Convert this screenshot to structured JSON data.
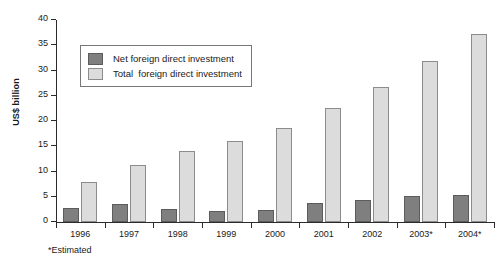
{
  "chart_data": {
    "type": "bar",
    "title": "",
    "xlabel": "",
    "ylabel": "US$ billion",
    "ylim": [
      0,
      40
    ],
    "yticks": [
      0,
      5,
      10,
      15,
      20,
      25,
      30,
      35,
      40
    ],
    "ytick_labels": [
      "0",
      "5",
      "10",
      "15",
      "20",
      "25",
      "30",
      "35",
      "40"
    ],
    "grid": false,
    "legend_position": "upper-left-inside",
    "categories": [
      "1996",
      "1997",
      "1998",
      "1999",
      "2000",
      "2001",
      "2002",
      "2003*",
      "2004*"
    ],
    "series": [
      {
        "name": "Net foreign direct investment",
        "legend_label": "Net foreign direct investment",
        "color": "#7f7f7f",
        "values": [
          2.8,
          3.6,
          2.6,
          2.2,
          2.4,
          3.8,
          4.4,
          5.2,
          5.4
        ]
      },
      {
        "name": "Total  foreign direct investment",
        "legend_label": "Total  foreign direct investment",
        "color": "#dcdcdc",
        "values": [
          8.0,
          11.3,
          14.0,
          16.0,
          18.6,
          22.5,
          26.8,
          31.9,
          37.3
        ]
      }
    ],
    "annotations": [
      "*Estimated"
    ]
  },
  "footnote": "*Estimated"
}
